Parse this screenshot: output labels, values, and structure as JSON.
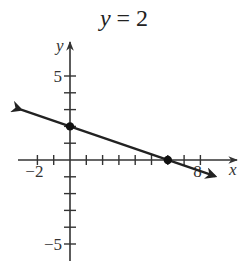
{
  "chart_data": {
    "type": "line",
    "title": "y = 2",
    "title_var": "y",
    "title_rest": " = 2",
    "xlabel": "x",
    "ylabel": "y",
    "xlim": [
      -3,
      8.5
    ],
    "ylim": [
      -6,
      6
    ],
    "x_tick_step": 1,
    "y_tick_step": 1,
    "x_tick_labels": [
      {
        "value": -2,
        "text": "−2"
      },
      {
        "value": 8,
        "text": "8"
      }
    ],
    "y_tick_labels": [
      {
        "value": 5,
        "text": "5"
      },
      {
        "value": -5,
        "text": "−5"
      }
    ],
    "grid": false,
    "series": [
      {
        "name": "line",
        "equation": "y = -x/3 + 2",
        "slope": -0.3333,
        "intercept": 2,
        "x_range": [
          -3,
          8.9
        ],
        "arrows": "both",
        "points": [
          {
            "x": 0,
            "y": 2
          },
          {
            "x": 6,
            "y": 0
          }
        ]
      }
    ],
    "colors": {
      "axis": "#333333",
      "line": "#222222",
      "point": "#111111"
    }
  }
}
